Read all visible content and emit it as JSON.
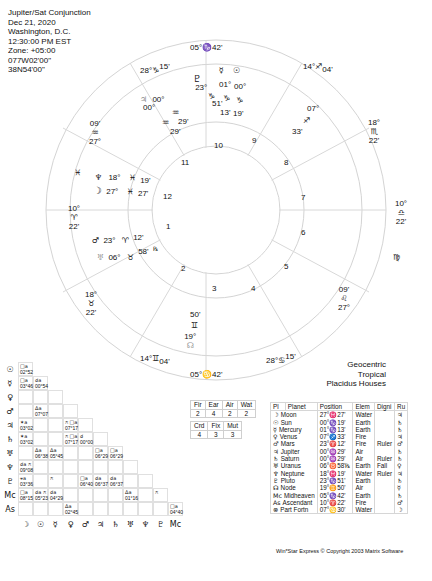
{
  "header": {
    "title": "Jupiter/Sat Conjunction",
    "date": "Dec 21, 2020",
    "location": "Washington, D.C.",
    "time": "12:30:00 PM EST",
    "zone": "Zone: +05:00",
    "longitude": "077W02'00\"",
    "latitude": "38N54'00\""
  },
  "chart_info": {
    "line1": "Geocentric",
    "line2": "Tropical",
    "line3": "Placidus Houses"
  },
  "wheel": {
    "house_numbers": [
      "1",
      "2",
      "3",
      "4",
      "5",
      "6",
      "7",
      "8",
      "9",
      "10",
      "11",
      "12"
    ],
    "cusps": {
      "mc": "05°♑42'",
      "ic": "05°♋42'",
      "c11_deg": "28°",
      "c11_sign": "♑",
      "c11_min": "15'",
      "c12_deg": "27°",
      "c12_sign": "♒",
      "c12_min": "09'",
      "asc_deg": "10°",
      "asc_sign": "♈",
      "asc_min": "22'",
      "c2_deg": "18°",
      "c2_sign": "♉",
      "c2_min": "22'",
      "c3_deg": "14°",
      "c3_sign": "♊",
      "c3_min": "04'",
      "c5_deg": "28°",
      "c5_sign": "♋",
      "c5_min": "15'",
      "c6_deg": "27°",
      "c6_sign": "♌",
      "c6_min": "09'",
      "desc_deg": "10°",
      "desc_sign": "♎",
      "desc_min": "22'",
      "c8_deg": "18°",
      "c8_sign": "♏",
      "c8_min": "22'",
      "c9_deg": "14°",
      "c9_sign": "♐",
      "c9_min": "04'"
    },
    "intercepted": {
      "pisces": "♓",
      "virgo": "♍"
    },
    "planets": [
      {
        "name": "Pluto",
        "glyph": "♇",
        "deg": "23°",
        "sign": "♑",
        "min": "51'"
      },
      {
        "name": "Jupiter",
        "glyph": "♃",
        "deg": "00°",
        "sign": "♒",
        "min": "29'"
      },
      {
        "name": "Saturn",
        "glyph": "♄",
        "deg": "00°",
        "sign": "♒",
        "min": "29'"
      },
      {
        "name": "Mercury",
        "glyph": "☿",
        "deg": "01°",
        "sign": "♑",
        "min": "13'"
      },
      {
        "name": "Sun",
        "glyph": "☉",
        "deg": "00°",
        "sign": "♑",
        "min": "19'"
      },
      {
        "name": "Venus",
        "glyph": "♀",
        "deg": "07°",
        "sign": "♐",
        "min": "33'"
      },
      {
        "name": "Neptune",
        "glyph": "♆",
        "deg": "18°",
        "sign": "♓",
        "min": "19'"
      },
      {
        "name": "Moon",
        "glyph": "☽",
        "deg": "27°",
        "sign": "♓",
        "min": "27'"
      },
      {
        "name": "Mars",
        "glyph": "♂",
        "deg": "23°",
        "sign": "♈",
        "min": "12'"
      },
      {
        "name": "Uranus",
        "glyph": "♅",
        "deg": "06°",
        "sign": "♉",
        "min": "58'",
        "retro": "℞"
      },
      {
        "name": "Node",
        "glyph": "☊",
        "deg": "19°",
        "sign": "♊",
        "min": "50'"
      }
    ]
  },
  "elements": {
    "headers": [
      "Fir",
      "Ear",
      "Air",
      "Wat"
    ],
    "values": [
      "2",
      "4",
      "2",
      "2"
    ],
    "mode_headers": [
      "Crd",
      "Fix",
      "Mut"
    ],
    "mode_values": [
      "4",
      "3",
      "3"
    ]
  },
  "planet_table": {
    "headers": [
      "Pl",
      "Planet",
      "Position",
      "Elem",
      "Digni",
      "Ru"
    ],
    "rows": [
      {
        "glyph": "☽",
        "name": "Moon",
        "pos": "27°♓27'",
        "elem": "Water",
        "dig": "",
        "ru": "♃"
      },
      {
        "glyph": "☉",
        "name": "Sun",
        "pos": "00°♑19'",
        "elem": "Earth",
        "dig": "",
        "ru": "♄"
      },
      {
        "glyph": "☿",
        "name": "Mercury",
        "pos": "01°♑13'",
        "elem": "Earth",
        "dig": "",
        "ru": "♄"
      },
      {
        "glyph": "♀",
        "name": "Venus",
        "pos": "07°♐33'",
        "elem": "Fire",
        "dig": "",
        "ru": "♃"
      },
      {
        "glyph": "♂",
        "name": "Mars",
        "pos": "23°♈12'",
        "elem": "Fire",
        "dig": "Ruler",
        "ru": "♂"
      },
      {
        "glyph": "♃",
        "name": "Jupiter",
        "pos": "00°♒29'",
        "elem": "Air",
        "dig": "",
        "ru": "♄"
      },
      {
        "glyph": "♄",
        "name": "Saturn",
        "pos": "00°♒29'",
        "elem": "Air",
        "dig": "Ruler",
        "ru": "♄"
      },
      {
        "glyph": "♅",
        "name": "Uranus",
        "pos": "06°♉58'℞",
        "elem": "Earth",
        "dig": "Fall",
        "ru": "♀"
      },
      {
        "glyph": "♆",
        "name": "Neptune",
        "pos": "18°♓19'",
        "elem": "Water",
        "dig": "Ruler",
        "ru": "♃"
      },
      {
        "glyph": "♇",
        "name": "Pluto",
        "pos": "23°♑51'",
        "elem": "Earth",
        "dig": "",
        "ru": "♄"
      },
      {
        "glyph": "☊",
        "name": "Node",
        "pos": "19°♊50'",
        "elem": "Air",
        "dig": "",
        "ru": "☿"
      },
      {
        "glyph": "Mc",
        "name": "Midheaven",
        "pos": "05°♑42'",
        "elem": "Earth",
        "dig": "",
        "ru": "♄"
      },
      {
        "glyph": "As",
        "name": "Ascendant",
        "pos": "10°♈22'",
        "elem": "Fire",
        "dig": "",
        "ru": "♂"
      },
      {
        "glyph": "⊗",
        "name": "Part Fortn",
        "pos": "07°♋30'",
        "elem": "Water",
        "dig": "",
        "ru": "☽"
      }
    ]
  },
  "aspect_grid": {
    "row_labels": [
      "☉",
      "☿",
      "♀",
      "♂",
      "♃",
      "♄",
      "♅",
      "♆",
      "♇",
      "Mc",
      "As"
    ],
    "col_labels": [
      "☽",
      "☉",
      "☿",
      "♀",
      "♂",
      "♃",
      "♄",
      "♅",
      "♆",
      "♇",
      "Mc"
    ],
    "cells": [
      {
        "r": 0,
        "c": 0,
        "asp": "□a",
        "orb": "02°52"
      },
      {
        "r": 1,
        "c": 0,
        "asp": "□a",
        "orb": "03°46"
      },
      {
        "r": 1,
        "c": 1,
        "asp": "☌a",
        "orb": "00°54"
      },
      {
        "r": 3,
        "c": 1,
        "asp": "Δa",
        "orb": "07°07"
      },
      {
        "r": 4,
        "c": 0,
        "asp": "✶a",
        "orb": "03°02"
      },
      {
        "r": 4,
        "c": 3,
        "asp": "⚻ □a",
        "orb": "07°17"
      },
      {
        "r": 5,
        "c": 0,
        "asp": "✶a",
        "orb": "03°02"
      },
      {
        "r": 5,
        "c": 3,
        "asp": "⚻ □a",
        "orb": "07°17"
      },
      {
        "r": 5,
        "c": 4,
        "asp": "☌",
        "orb": "00°00"
      },
      {
        "r": 6,
        "c": 1,
        "asp": "Δa",
        "orb": "06°38"
      },
      {
        "r": 6,
        "c": 2,
        "asp": "Δa",
        "orb": "05°45"
      },
      {
        "r": 6,
        "c": 5,
        "asp": "□a",
        "orb": "06°29"
      },
      {
        "r": 6,
        "c": 6,
        "asp": "□a",
        "orb": "06°29"
      },
      {
        "r": 7,
        "c": 0,
        "asp": "☌a ⚻",
        "orb": "09°08"
      },
      {
        "r": 8,
        "c": 0,
        "asp": "⚹a",
        "orb": "03°36"
      },
      {
        "r": 8,
        "c": 2,
        "asp": "⚻",
        "orb": ""
      },
      {
        "r": 8,
        "c": 4,
        "asp": "□a",
        "orb": "06°40"
      },
      {
        "r": 8,
        "c": 5,
        "asp": "☌a",
        "orb": "06°37"
      },
      {
        "r": 8,
        "c": 6,
        "asp": "☌a",
        "orb": "06°37"
      },
      {
        "r": 9,
        "c": 0,
        "asp": "□a",
        "orb": "08°15"
      },
      {
        "r": 9,
        "c": 1,
        "asp": "☌a ⚻",
        "orb": "05°23"
      },
      {
        "r": 9,
        "c": 2,
        "asp": "☌a",
        "orb": "04°29"
      },
      {
        "r": 9,
        "c": 7,
        "asp": "Δa",
        "orb": "01°16"
      },
      {
        "r": 9,
        "c": 9,
        "asp": "⚻",
        "orb": ""
      },
      {
        "r": 10,
        "c": 3,
        "asp": "Δa",
        "orb": "02°45"
      },
      {
        "r": 10,
        "c": 10,
        "asp": "□a",
        "orb": "04°40"
      }
    ]
  },
  "footer": {
    "copyright": "Win*Star Express © Copyright 2003 Matrix Software"
  },
  "colors": {
    "lines": "#cfcfcf",
    "text": "#111111",
    "background": "#ffffff"
  }
}
